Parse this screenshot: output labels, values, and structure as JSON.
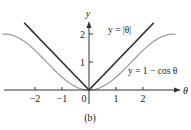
{
  "chart_data": {
    "type": "line",
    "title": "",
    "caption": "(b)",
    "xlabel": "θ",
    "ylabel": "y",
    "xlim": [
      -3.3,
      3.4
    ],
    "ylim": [
      0,
      2.5
    ],
    "xticks": [
      -2,
      -1,
      0,
      1,
      2
    ],
    "xtick_labels": [
      "−2",
      "−1",
      "0",
      "1",
      "2"
    ],
    "yticks": [
      1,
      2
    ],
    "ytick_labels": [
      "1",
      "2"
    ],
    "grid": false,
    "series": [
      {
        "name": "y = |θ|",
        "function": "abs",
        "domain": [
          -2.4,
          2.4
        ],
        "color": "#333333"
      },
      {
        "name": "y = 1 − cos θ",
        "function": "one_minus_cos",
        "domain": [
          -3.2,
          3.2
        ],
        "color": "#9a9a9a"
      }
    ],
    "annotations": [
      {
        "text": "y = |θ|",
        "near_series": 0
      },
      {
        "text": "y = 1 − cos θ",
        "near_series": 1
      }
    ]
  }
}
